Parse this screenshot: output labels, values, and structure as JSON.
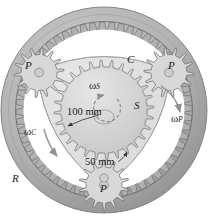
{
  "figure": {
    "type": "mechanical-diagram",
    "background": "#ffffff",
    "colors": {
      "ring_gear": "#b0b0b0",
      "ring_gear_dark": "#8e8e8e",
      "carrier": "#e1e1e1",
      "carrier_edge": "#6e6e6e",
      "planet": "#d8d8d8",
      "sun": "#dcdcdc",
      "label": "#1a1a1a",
      "arrow": "#8a8a8a"
    }
  },
  "labels": {
    "ring": "R",
    "carrier": "C",
    "sun": "S",
    "planet_top_left": "P",
    "planet_top_right": "P",
    "planet_bottom": "P",
    "omega_sun": "ω",
    "omega_sun_sub": "S",
    "omega_planet": "ω",
    "omega_planet_sub": "P",
    "omega_carrier": "ω",
    "omega_carrier_sub": "C",
    "dim_sun": "100 mm",
    "dim_planet": "50 mm"
  },
  "geometry": {
    "ring_outer_radius_px": 103,
    "ring_inner_radius_px": 88,
    "ring_teeth": 56,
    "sun_radius_px": 50,
    "sun_teeth": 28,
    "planet_radius_px": 25,
    "planet_teeth": 14,
    "planet_orbit_radius_px": 75,
    "planet_angles_deg": [
      210,
      330,
      90
    ],
    "center": {
      "x": 104,
      "y": 110
    }
  },
  "dimensions": {
    "sun_diameter": "100 mm",
    "planet_diameter": "50 mm"
  }
}
